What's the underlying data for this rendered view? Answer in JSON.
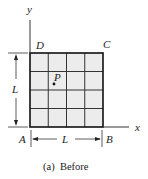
{
  "figure": {
    "caption": "(a)  Before",
    "axes": {
      "x_label": "x",
      "y_label": "y"
    },
    "corners": {
      "A": "A",
      "B": "B",
      "C": "C",
      "D": "D"
    },
    "point": {
      "label": "P"
    },
    "dimensions": {
      "width_label": "L",
      "height_label": "L"
    },
    "grid": {
      "rows": 4,
      "cols": 4,
      "fill": "#ececec",
      "line": "#222222"
    }
  }
}
